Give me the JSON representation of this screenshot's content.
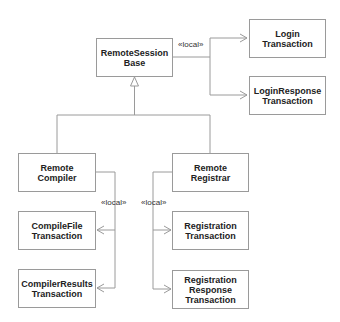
{
  "diagram": {
    "classes": {
      "remote_session_base": {
        "line1": "RemoteSession",
        "line2": "Base"
      },
      "login_transaction": {
        "line1": "Login",
        "line2": "Transaction"
      },
      "login_response_transaction": {
        "line1": "LoginResponse",
        "line2": "Transaction"
      },
      "remote_compiler": {
        "line1": "Remote",
        "line2": "Compiler"
      },
      "remote_registrar": {
        "line1": "Remote",
        "line2": "Registrar"
      },
      "compile_file_transaction": {
        "line1": "CompileFile",
        "line2": "Transaction"
      },
      "compiler_results_transaction": {
        "line1": "CompilerResults",
        "line2": "Transaction"
      },
      "registration_transaction": {
        "line1": "Registration",
        "line2": "Transaction"
      },
      "registration_response_transaction": {
        "line1": "Registration",
        "line2": "Response",
        "line3": "Transaction"
      }
    },
    "stereotypes": {
      "base_local": "«local»",
      "compiler_local": "«local»",
      "registrar_local": "«local»"
    },
    "colors": {
      "line": "#9a9a9a",
      "text": "#222222"
    }
  }
}
